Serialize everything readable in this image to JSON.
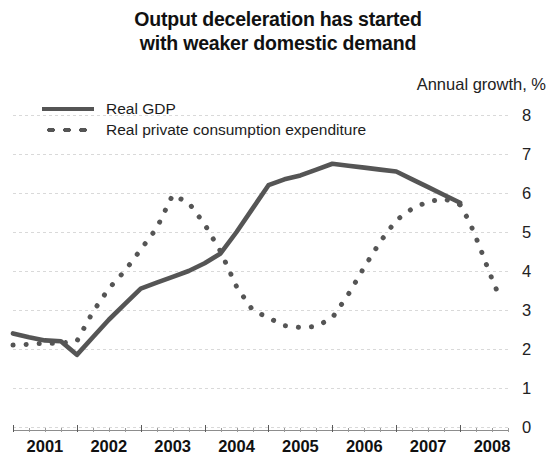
{
  "chart_data": {
    "type": "line",
    "title": "Output deceleration has started\nwith weaker domestic demand",
    "ylabel": "Annual growth, %",
    "xlabel": "",
    "ylim": [
      0,
      8
    ],
    "yticks": [
      8,
      7,
      6,
      5,
      4,
      3,
      2,
      1,
      0
    ],
    "grid": true,
    "legend_position": "top-left",
    "xtick_labels": [
      "2001",
      "2002",
      "2003",
      "2004",
      "2005",
      "2006",
      "2007",
      "2008"
    ],
    "x_unit": "quarter",
    "series": [
      {
        "name": "Real GDP",
        "style": "solid",
        "color": "#555555",
        "x": [
          2001.0,
          2001.25,
          2001.5,
          2001.75,
          2002.0,
          2002.25,
          2002.5,
          2002.75,
          2003.0,
          2003.25,
          2003.5,
          2003.75,
          2004.0,
          2004.25,
          2004.5,
          2004.75,
          2005.0,
          2005.25,
          2005.5,
          2005.75,
          2006.0,
          2006.25,
          2006.5,
          2006.75,
          2007.0,
          2007.25,
          2007.5,
          2007.75,
          2008.0
        ],
        "values": [
          2.4,
          2.3,
          2.22,
          2.2,
          1.85,
          2.3,
          2.75,
          3.15,
          3.55,
          3.7,
          3.85,
          4.0,
          4.2,
          4.45,
          5.0,
          5.6,
          6.2,
          6.35,
          6.45,
          6.6,
          6.75,
          6.7,
          6.65,
          6.6,
          6.55,
          6.35,
          6.15,
          5.95,
          5.75
        ]
      },
      {
        "name": "Real private consumption expenditure",
        "style": "dotted",
        "color": "#555555",
        "x": [
          2001.0,
          2001.25,
          2001.5,
          2001.75,
          2002.0,
          2002.25,
          2002.5,
          2002.75,
          2003.0,
          2003.25,
          2003.5,
          2003.75,
          2004.0,
          2004.25,
          2004.5,
          2004.75,
          2005.0,
          2005.25,
          2005.5,
          2005.75,
          2006.0,
          2006.25,
          2006.5,
          2006.75,
          2007.0,
          2007.25,
          2007.5,
          2007.75,
          2008.0
        ],
        "values": [
          2.1,
          2.12,
          2.15,
          2.15,
          2.2,
          2.95,
          3.55,
          4.0,
          4.55,
          5.1,
          5.95,
          5.75,
          5.2,
          4.5,
          3.6,
          3.0,
          2.8,
          2.6,
          2.55,
          2.58,
          2.8,
          3.4,
          4.1,
          4.75,
          5.3,
          5.6,
          5.78,
          5.85,
          5.7
        ]
      },
      {
        "name": "Real private consumption expenditure (tail)",
        "style": "dotted",
        "color": "#555555",
        "x": [
          2008.0,
          2008.15,
          2008.3,
          2008.45,
          2008.6
        ],
        "values": [
          5.7,
          5.25,
          4.65,
          4.0,
          3.4
        ]
      }
    ]
  },
  "legend": {
    "items": [
      {
        "label": "Real GDP",
        "key": "solid-line-key"
      },
      {
        "label": "Real private consumption expenditure",
        "key": "dotted-line-key"
      }
    ]
  }
}
